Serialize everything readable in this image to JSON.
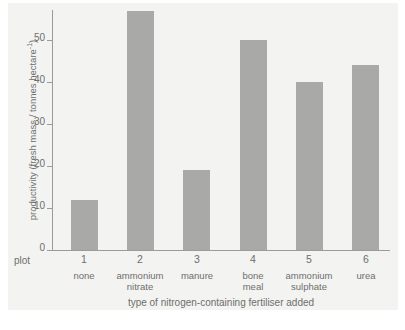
{
  "chart_data": {
    "type": "bar",
    "title": "",
    "subtitle": "",
    "xlabel": "type of nitrogen-containing fertiliser added",
    "ylabel": "productivity (fresh mass / tonnes hectare",
    "ylabel_exponent": "-1",
    "ylabel_tail": ")",
    "categories": [
      "none",
      "ammonium nitrate",
      "manure",
      "bone meal",
      "ammonium sulphate",
      "urea"
    ],
    "values": [
      12,
      57,
      19,
      50,
      40,
      44
    ],
    "plot_numbers": [
      "1",
      "2",
      "3",
      "4",
      "5",
      "6"
    ],
    "plot_row_label": "plot",
    "ylim": [
      0,
      57
    ],
    "yticks": [
      0,
      10,
      20,
      30,
      40,
      50
    ],
    "ytick_labels": [
      "0",
      "10",
      "20",
      "30",
      "40",
      "50"
    ],
    "grid": false,
    "legend": false,
    "bar_color": "#a9a9a7",
    "axis_color": "#9b9b9b",
    "text_color": "#6e6e6e",
    "panel_color": "#f3f3f1"
  },
  "x_categories": [
    {
      "number": "1",
      "line1": "none",
      "line2": ""
    },
    {
      "number": "2",
      "line1": "ammonium",
      "line2": "nitrate"
    },
    {
      "number": "3",
      "line1": "manure",
      "line2": ""
    },
    {
      "number": "4",
      "line1": "bone",
      "line2": "meal"
    },
    {
      "number": "5",
      "line1": "ammonium",
      "line2": "sulphate"
    },
    {
      "number": "6",
      "line1": "urea",
      "line2": ""
    }
  ],
  "y_ticks": [
    {
      "label": "50",
      "value": 50
    },
    {
      "label": "40",
      "value": 40
    },
    {
      "label": "30",
      "value": 30
    },
    {
      "label": "20",
      "value": 20
    },
    {
      "label": "10",
      "value": 10
    },
    {
      "label": "0",
      "value": 0
    }
  ]
}
